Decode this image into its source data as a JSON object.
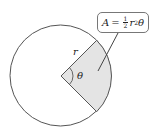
{
  "diagram": {
    "type": "circle-sector",
    "circle": {
      "cx": 60.5,
      "cy": 75.5,
      "r": 50.5,
      "stroke": "#555555",
      "fill": "#ffffff"
    },
    "sector": {
      "start_deg": -45,
      "end_deg": 45,
      "fill": "#e4e4e4",
      "stroke": "#555555"
    },
    "labels": {
      "radius": "r",
      "angle": "θ"
    },
    "formula": {
      "lhs": "A",
      "equals": "=",
      "frac_num": "1",
      "frac_den": "2",
      "var": "r",
      "exp": "2",
      "angle": "θ"
    }
  }
}
